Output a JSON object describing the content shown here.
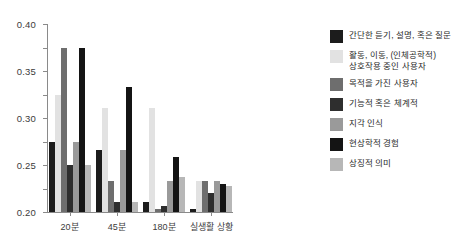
{
  "chart_data": {
    "type": "bar",
    "title": "",
    "xlabel": "",
    "ylabel": "",
    "ylim": [
      0.0,
      0.4
    ],
    "yticks": [
      "0.00",
      "0.05",
      "0.10",
      "0.15",
      "0.20",
      "0.25",
      "0.30",
      "0.35",
      "0.40"
    ],
    "ytick_values": [
      0.0,
      0.05,
      0.1,
      0.15,
      0.2,
      0.25,
      0.3,
      0.35,
      0.4
    ],
    "grid": false,
    "legend_position": "right",
    "categories": [
      "20분",
      "45분",
      "180분",
      "실생활 상황"
    ],
    "series": [
      {
        "name": "간단한 듣기, 설명, 혹은 질문",
        "color": "#1c1c1c",
        "values": [
          0.15,
          0.133,
          0.022,
          0.006
        ]
      },
      {
        "name": "활동, 이동, (인체공학적)\n상호작용 중인 사용자",
        "color": "#e2e2e2",
        "values": [
          0.25,
          0.222,
          0.222,
          0.067
        ]
      },
      {
        "name": "목적을 가진 사용자",
        "color": "#6e6e6e",
        "values": [
          0.35,
          0.067,
          0.006,
          0.067
        ]
      },
      {
        "name": "기능적 혹은 체계적",
        "color": "#2e2e2e",
        "values": [
          0.1,
          0.022,
          0.012,
          0.04
        ]
      },
      {
        "name": "지각 인식",
        "color": "#9a9a9a",
        "values": [
          0.15,
          0.133,
          0.067,
          0.067
        ]
      },
      {
        "name": "현상학적 경험",
        "color": "#141414",
        "values": [
          0.35,
          0.267,
          0.118,
          0.06
        ]
      },
      {
        "name": "상징적 의미",
        "color": "#b7b7b7",
        "values": [
          0.1,
          0.022,
          0.074,
          0.055
        ]
      }
    ]
  }
}
